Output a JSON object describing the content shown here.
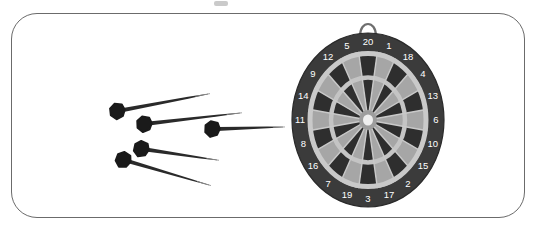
{
  "scene": {
    "title": "Dartboard with five darts",
    "background_color": "#ffffff",
    "frame": {
      "name": "rounded-rectangle-border",
      "stroke_color": "#6b6b6b",
      "corner_radius": 26
    }
  },
  "dartboard": {
    "name": "dartboard",
    "center_x": 368,
    "center_y": 120,
    "radius_x": 76,
    "radius_y": 87,
    "number_ring_color": "#3b3b3b",
    "number_text_color": "#ffffff",
    "segment_dark_color": "#2e2e2e",
    "segment_light_color": "#a6a6a6",
    "ring_highlight_color": "#c9c9c9",
    "bullseye_outer_color": "#9d9d9d",
    "bullseye_inner_color": "#efefef",
    "hanger": {
      "name": "hanging-loop",
      "label": "hanging loop",
      "color": "#6e6e6e"
    },
    "segment_order": [
      20,
      1,
      18,
      4,
      13,
      6,
      10,
      15,
      2,
      17,
      3,
      19,
      7,
      16,
      8,
      11,
      14,
      9,
      12,
      5
    ],
    "numbers": [
      {
        "value": "20",
        "angle_deg": 0
      },
      {
        "value": "1",
        "angle_deg": 18
      },
      {
        "value": "18",
        "angle_deg": 36
      },
      {
        "value": "4",
        "angle_deg": 54
      },
      {
        "value": "13",
        "angle_deg": 72
      },
      {
        "value": "6",
        "angle_deg": 90
      },
      {
        "value": "10",
        "angle_deg": 108
      },
      {
        "value": "15",
        "angle_deg": 126
      },
      {
        "value": "2",
        "angle_deg": 144
      },
      {
        "value": "17",
        "angle_deg": 162
      },
      {
        "value": "3",
        "angle_deg": 180
      },
      {
        "value": "19",
        "angle_deg": 198
      },
      {
        "value": "7",
        "angle_deg": 216
      },
      {
        "value": "16",
        "angle_deg": 234
      },
      {
        "value": "8",
        "angle_deg": 252
      },
      {
        "value": "11",
        "angle_deg": 270
      },
      {
        "value": "14",
        "angle_deg": 288
      },
      {
        "value": "9",
        "angle_deg": 306
      },
      {
        "value": "12",
        "angle_deg": 324
      },
      {
        "value": "5",
        "angle_deg": 342
      }
    ]
  },
  "darts": {
    "count": 5,
    "flight_color": "#1a1a1a",
    "shaft_color": "#2a2a2a",
    "tip_color": "#8f8f8f",
    "items": [
      {
        "name": "dart-1",
        "label": "dart 1",
        "flight_x": 118,
        "flight_y": 111,
        "tip_x": 208,
        "tip_y": 94
      },
      {
        "name": "dart-2",
        "label": "dart 2",
        "flight_x": 145,
        "flight_y": 124,
        "tip_x": 240,
        "tip_y": 113
      },
      {
        "name": "dart-3",
        "label": "dart 3",
        "flight_x": 213,
        "flight_y": 129,
        "tip_x": 283,
        "tip_y": 127
      },
      {
        "name": "dart-4",
        "label": "dart 4",
        "flight_x": 142,
        "flight_y": 149,
        "tip_x": 217,
        "tip_y": 160
      },
      {
        "name": "dart-5",
        "label": "dart 5",
        "flight_x": 124,
        "flight_y": 160,
        "tip_x": 209,
        "tip_y": 185
      }
    ]
  }
}
